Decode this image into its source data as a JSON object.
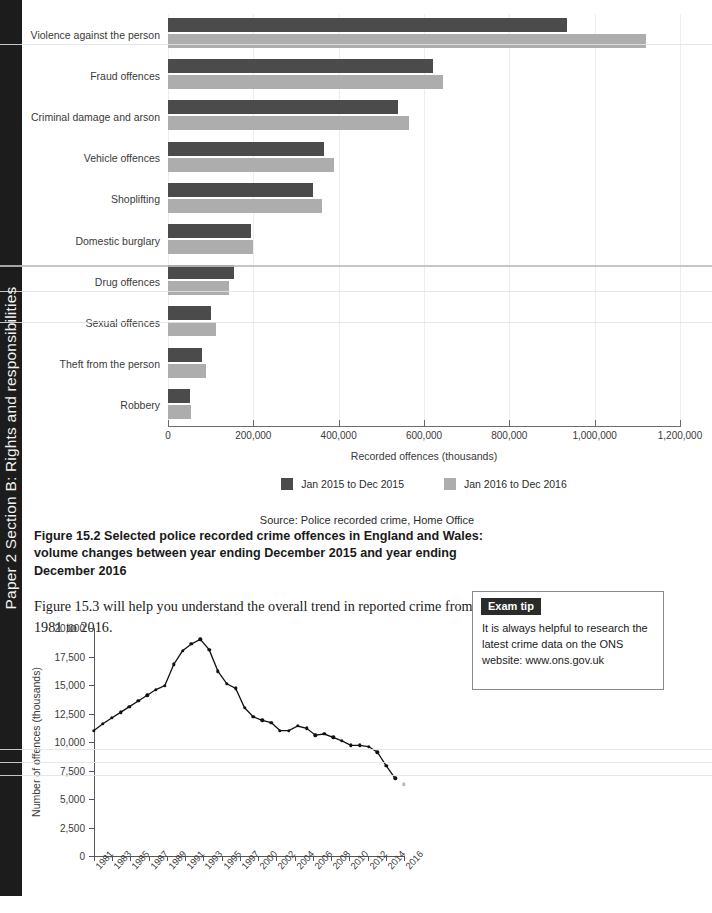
{
  "side_tab": {
    "text": "Paper 2 Section B: Rights and responsibilities"
  },
  "bar_figure": {
    "source": "Source: Police recorded crime, Home Office",
    "caption": "Figure 15.2 Selected police recorded crime offences in England and Wales: volume changes between year ending December 2015 and year ending December 2016",
    "legend": [
      {
        "label": "Jan 2015 to Dec 2015",
        "color": "#4b4b4b"
      },
      {
        "label": "Jan 2016 to Dec 2016",
        "color": "#adadad"
      }
    ]
  },
  "body_paragraph": "Figure 15.3 will help you understand the overall trend in reported crime from 1981 to 2016.",
  "exam_tip": {
    "heading": "Exam tip",
    "body": "It is always helpful to research the latest crime data on the ONS website: www.ons.gov.uk"
  },
  "line_figure": {
    "source": "Source: Crime Survey for England and Wales, ONS"
  },
  "chart_data": [
    {
      "type": "bar",
      "orientation": "horizontal",
      "title": "Figure 15.2 Selected police recorded crime offences in England and Wales: volume changes between year ending December 2015 and year ending December 2016",
      "xlabel": "Recorded offences (thousands)",
      "ylabel": "",
      "xlim": [
        0,
        1200000
      ],
      "xticks": [
        0,
        200000,
        400000,
        600000,
        800000,
        1000000,
        1200000
      ],
      "xticklabels": [
        "0",
        "200,000",
        "400,000",
        "600,000",
        "800,000",
        "1,000,000",
        "1,200,000"
      ],
      "grid": true,
      "legend_position": "bottom",
      "categories": [
        "Violence against the person",
        "Fraud offences",
        "Criminal damage and arson",
        "Vehicle offences",
        "Shoplifting",
        "Domestic burglary",
        "Drug offences",
        "Sexual offences",
        "Theft from the person",
        "Robbery"
      ],
      "series": [
        {
          "name": "Jan 2015 to Dec 2015",
          "color": "#4b4b4b",
          "values": [
            935000,
            620000,
            540000,
            365000,
            340000,
            195000,
            155000,
            100000,
            80000,
            52000
          ]
        },
        {
          "name": "Jan 2016 to Dec 2016",
          "color": "#adadad",
          "values": [
            1120000,
            645000,
            565000,
            390000,
            360000,
            200000,
            143000,
            113000,
            88000,
            55000
          ]
        }
      ],
      "source": "Source: Police recorded crime, Home Office"
    },
    {
      "type": "line",
      "title": "Figure 15.3",
      "xlabel": "",
      "ylabel": "Number of offences (thousands)",
      "ylim": [
        0,
        20000
      ],
      "yticks": [
        0,
        2500,
        5000,
        7500,
        10000,
        12500,
        15000,
        17500,
        20000
      ],
      "yticklabels": [
        "0",
        "2,500",
        "5,000",
        "7,500",
        "10,000",
        "12,500",
        "15,000",
        "17,500",
        "20,000"
      ],
      "xticklabels": [
        "1981",
        "1983",
        "1985",
        "1987",
        "1989",
        "1991",
        "1993",
        "1995",
        "1997",
        "2000",
        "2002",
        "2004",
        "2006",
        "2008",
        "2010",
        "2012",
        "2014",
        "2016"
      ],
      "grid": false,
      "legend_position": "none",
      "x": [
        "1981",
        "1982",
        "1983",
        "1984",
        "1985",
        "1986",
        "1987",
        "1988",
        "1989",
        "1990",
        "1991",
        "1992",
        "1993",
        "1994",
        "1995",
        "1996",
        "1997",
        "1998",
        "1999",
        "2000",
        "2001",
        "2002",
        "2003",
        "2004",
        "2005",
        "2006",
        "2007",
        "2008",
        "2009",
        "2010",
        "2011",
        "2012",
        "2013",
        "2014",
        "2015",
        "2016"
      ],
      "series": [
        {
          "name": "Number of offences (thousands)",
          "color": "#111111",
          "values": [
            11000,
            11600,
            12100,
            12600,
            13100,
            13600,
            14100,
            14600,
            14950,
            16800,
            18000,
            18600,
            19000,
            18100,
            16200,
            15100,
            14700,
            13000,
            12200,
            11900,
            11700,
            11000,
            11000,
            11400,
            11200,
            10600,
            10700,
            10400,
            10100,
            9700,
            9700,
            9600,
            9100,
            7900,
            6800,
            6300
          ]
        }
      ],
      "source": "Source: Crime Survey for England and Wales, ONS"
    }
  ]
}
